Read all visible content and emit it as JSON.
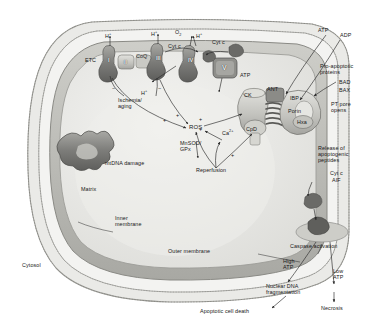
{
  "figure": {
    "type": "biological-pathway-diagram",
    "palette": {
      "cytosol": "#f2f2f0",
      "outer_membrane": "#d8d8d4",
      "inner_membrane": "#b9b9b4",
      "matrix": "#e8e8e5",
      "protein_dark": "#6e6e6c",
      "protein_mid": "#9a9a96",
      "protein_light": "#cfcfca",
      "line": "#2a2a2a",
      "text": "#171717"
    }
  },
  "compartments": {
    "cytosol": "Cytosol",
    "matrix": "Matrix",
    "inner_membrane": "Inner\nmembrane",
    "outer_membrane": "Outer membrane"
  },
  "etc": {
    "label": "ETC",
    "complexes": [
      "I",
      "II",
      "III",
      "IV",
      "V"
    ],
    "carriers": {
      "coq": "CoQ",
      "cytc_inner": "Cyt c",
      "cytc_outer": "Cyt c",
      "cytc_complex": "Cyt c"
    },
    "protons": [
      "H",
      "H",
      "H",
      "H"
    ],
    "proton_symbol": "H",
    "proton_charge": "+",
    "oxygen": "O",
    "oxygen_sub": "2",
    "atp_produced": "ATP"
  },
  "pt_pore": {
    "ck": "CK",
    "ant": "ANT",
    "ibp": "IBP",
    "porin": "Porin",
    "hxk": "Hxa",
    "cpd": "CpD",
    "atp_in": "ATP",
    "adp_in": "ADP"
  },
  "stress": {
    "ischemia_aging": "Ischemia/\naging",
    "ros": "ROS",
    "calcium": "Ca",
    "calcium_sup": "2+",
    "antioxidants": "MnSOD/\nGPx",
    "reperfusion": "Reperfusion",
    "mtdna_damage": "mtDNA damage",
    "plus_signs": [
      "+",
      "+",
      "+",
      "+",
      "+"
    ],
    "minus_signs": [
      "−",
      "−"
    ]
  },
  "apoptosis": {
    "pro_apoptotic": "Pro-apoptotic\nproteins",
    "bad": "BAD",
    "bax": "BAX",
    "pt_pore_opens": "PT pore\nopens",
    "release": "Release of\napoptogenic\npeptides",
    "cytc": "Cyt c",
    "aif": "AIF",
    "caspase": "Caspase activation",
    "high_atp": "High\nATP",
    "low_atp": "Low\nATP",
    "dna_frag": "Nuclear DNA\nfragmentation",
    "apoptotic_death": "Apoptotic cell death",
    "necrosis": "Necrosis"
  }
}
